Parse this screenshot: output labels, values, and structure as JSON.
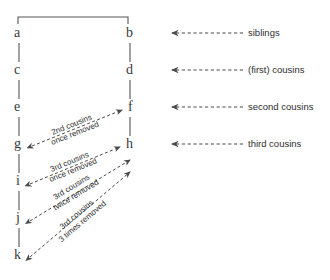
{
  "diagram": {
    "line_color": "#555555",
    "text_color": "#2e2e2e",
    "background": "#ffffff",
    "left_column": [
      {
        "id": "a",
        "label": "a",
        "x": 14,
        "y": 37
      },
      {
        "id": "c",
        "label": "c",
        "x": 14,
        "y": 74
      },
      {
        "id": "e",
        "label": "e",
        "x": 14,
        "y": 111
      },
      {
        "id": "g",
        "label": "g",
        "x": 14,
        "y": 148
      },
      {
        "id": "i",
        "label": "i",
        "x": 16,
        "y": 185
      },
      {
        "id": "j",
        "label": "j",
        "x": 16,
        "y": 222
      },
      {
        "id": "k",
        "label": "k",
        "x": 14,
        "y": 259
      }
    ],
    "right_column": [
      {
        "id": "b",
        "label": "b",
        "x": 126,
        "y": 37
      },
      {
        "id": "d",
        "label": "d",
        "x": 126,
        "y": 74
      },
      {
        "id": "f",
        "label": "f",
        "x": 128,
        "y": 111
      },
      {
        "id": "h",
        "label": "h",
        "x": 126,
        "y": 148
      }
    ],
    "relation_arrows": [
      {
        "id": "siblings",
        "label": "siblings",
        "y": 33,
        "text_x": 248
      },
      {
        "id": "first-cousins",
        "label": "(first) cousins",
        "y": 70,
        "text_x": 248
      },
      {
        "id": "second-cousins",
        "label": "second cousins",
        "y": 107,
        "text_x": 248
      },
      {
        "id": "third-cousins",
        "label": "third cousins",
        "y": 144,
        "text_x": 248
      }
    ],
    "diagonal_arrows": [
      {
        "id": "2nd-cousins-once-removed",
        "line1": "2nd cousins",
        "line2": "once removed",
        "from": "g",
        "to": "f",
        "x1": 32,
        "y1": 146,
        "x2": 122,
        "y2": 110,
        "label_x": 48,
        "label_y": 120,
        "rotate": -21.8
      },
      {
        "id": "3rd-cousins-once-removed",
        "line1": "3rd cousins",
        "line2": "once removed",
        "from": "i",
        "to": "h",
        "x1": 30,
        "y1": 184,
        "x2": 120,
        "y2": 147,
        "label_x": 46,
        "label_y": 157,
        "rotate": -22.3
      },
      {
        "id": "3rd-cousins-twice-removed",
        "line1": "3rd cousins",
        "line2": "twice removed",
        "from": "j",
        "to": "h",
        "x1": 30,
        "y1": 221,
        "x2": 130,
        "y2": 160,
        "label_x": 48,
        "label_y": 182,
        "rotate": -31.4
      },
      {
        "id": "3rd-cousins-3-times-removed",
        "line1": "3rd cousins",
        "line2": "3 times removed",
        "from": "k",
        "to": "h",
        "x1": 30,
        "y1": 257,
        "x2": 130,
        "y2": 172,
        "label_x": 50,
        "label_y": 209,
        "rotate": -40.3
      }
    ],
    "top_bracket": {
      "id": "sibling-bracket",
      "left_x": 18,
      "right_x": 128,
      "y": 17,
      "tick_height": 7
    },
    "vertical_connectors": [
      {
        "x": 19,
        "y1": 43,
        "y2": 62
      },
      {
        "x": 19,
        "y1": 80,
        "y2": 99
      },
      {
        "x": 19,
        "y1": 117,
        "y2": 136
      },
      {
        "x": 19,
        "y1": 154,
        "y2": 173
      },
      {
        "x": 19,
        "y1": 191,
        "y2": 210
      },
      {
        "x": 19,
        "y1": 228,
        "y2": 247
      },
      {
        "x": 130,
        "y1": 43,
        "y2": 62
      },
      {
        "x": 130,
        "y1": 80,
        "y2": 99
      },
      {
        "x": 130,
        "y1": 117,
        "y2": 136
      }
    ]
  }
}
